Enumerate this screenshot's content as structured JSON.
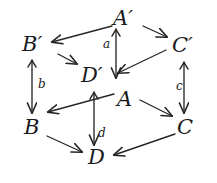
{
  "diagram": {
    "type": "commutative-cube-diagram",
    "stroke_color": "#262626",
    "text_color": "#1a1a1a",
    "background_color": "#ffffff",
    "nodes": [
      {
        "id": "A-prime",
        "label": "A′",
        "x": 113,
        "y": 8
      },
      {
        "id": "B-prime",
        "label": "B′",
        "x": 22,
        "y": 34
      },
      {
        "id": "C-prime",
        "label": "C′",
        "x": 172,
        "y": 35
      },
      {
        "id": "D-prime",
        "label": "D′",
        "x": 81,
        "y": 65
      },
      {
        "id": "A",
        "label": "A",
        "x": 117,
        "y": 89
      },
      {
        "id": "B",
        "label": "B",
        "x": 24,
        "y": 117
      },
      {
        "id": "C",
        "label": "C",
        "x": 177,
        "y": 117
      },
      {
        "id": "D",
        "label": "D",
        "x": 88,
        "y": 147
      }
    ],
    "edges": [
      {
        "id": "edge-Aprime-to-Bprime",
        "from": "A-prime",
        "to": "B-prime",
        "label": ""
      },
      {
        "id": "edge-Aprime-to-Cprime",
        "from": "A-prime",
        "to": "C-prime",
        "label": ""
      },
      {
        "id": "edge-Aprime-to-Dprime",
        "from": "A-prime",
        "to": "D-prime",
        "label": "a"
      },
      {
        "id": "edge-Bprime-to-Dprime",
        "from": "B-prime",
        "to": "D-prime",
        "label": ""
      },
      {
        "id": "edge-Cprime-to-Dprime",
        "from": "C-prime",
        "to": "D-prime",
        "label": ""
      },
      {
        "id": "edge-Bprime-to-B",
        "from": "B-prime",
        "to": "B",
        "label": "b"
      },
      {
        "id": "edge-Cprime-to-C",
        "from": "C-prime",
        "to": "C",
        "label": "c"
      },
      {
        "id": "edge-Dprime-to-D",
        "from": "D-prime",
        "to": "D",
        "label": "d"
      },
      {
        "id": "edge-A-to-B",
        "from": "A",
        "to": "B",
        "label": ""
      },
      {
        "id": "edge-A-to-C",
        "from": "A",
        "to": "C",
        "label": ""
      },
      {
        "id": "edge-B-to-D",
        "from": "B",
        "to": "D",
        "label": ""
      },
      {
        "id": "edge-C-to-D",
        "from": "C",
        "to": "D",
        "label": ""
      }
    ],
    "arrow_labels": [
      {
        "id": "label-a",
        "text": "a",
        "x": 103,
        "y": 38
      },
      {
        "id": "label-b",
        "text": "b",
        "x": 38,
        "y": 78
      },
      {
        "id": "label-c",
        "text": "c",
        "x": 176,
        "y": 80
      },
      {
        "id": "label-d",
        "text": "d",
        "x": 98,
        "y": 127
      }
    ]
  }
}
